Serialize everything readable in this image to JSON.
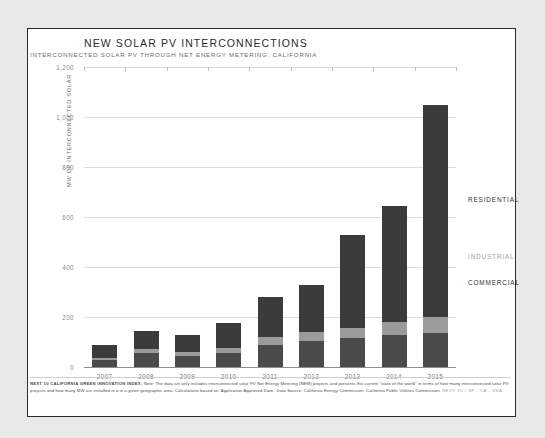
{
  "header": {
    "title": "NEW SOLAR PV INTERCONNECTIONS",
    "subtitle": "INTERCONNECTED SOLAR PV THROUGH NET ENERGY METERING, CALIFORNIA"
  },
  "legend": {
    "residential": "RESIDENTIAL",
    "industrial": "INDUSTRIAL",
    "commercial": "COMMERCIAL"
  },
  "colors": {
    "residential": "#3b3b3b",
    "industrial": "#9b9b9b",
    "commercial": "#4a4a4a",
    "frame": "#2a2a2a",
    "grid": "#dcdcdc",
    "page_background": "#e8e8e6"
  },
  "footnote": {
    "lead": "NEXT 10 CALIFORNIA GREEN INNOVATION INDEX.",
    "body": "Note: The data set only includes interconnected solar PV Net Energy Metering (NEM) projects and presents the current \"state of the world\" in terms of how many interconnected solar PV projects and how many MW are installed in a in a given geographic area. Calculations based on 'Application Approved Date.' Data Source: California Energy Commission; California Public Utilities Commission.",
    "tag": "NEXT 10 / SF - CA - USA"
  },
  "chart_data": {
    "type": "bar",
    "title": "NEW SOLAR PV INTERCONNECTIONS",
    "subtitle": "INTERCONNECTED SOLAR PV THROUGH NET ENERGY METERING, CALIFORNIA",
    "xlabel": "",
    "ylabel": "MW OF INTERCONNECTED SOLAR",
    "ylim": [
      0,
      1200
    ],
    "yticks": [
      0,
      200,
      400,
      600,
      800,
      1000,
      1200
    ],
    "ytick_labels": [
      "0",
      "200",
      "400",
      "600",
      "800",
      "1,000",
      "1,200"
    ],
    "grid": true,
    "stacked": true,
    "legend_position": "right",
    "categories": [
      "2007",
      "2008",
      "2009",
      "2010",
      "2011",
      "2012",
      "2013",
      "2014",
      "2015"
    ],
    "series": [
      {
        "name": "COMMERCIAL",
        "color": "#4a4a4a",
        "values": [
          30,
          55,
          45,
          55,
          90,
          105,
          115,
          130,
          135
        ]
      },
      {
        "name": "INDUSTRIAL",
        "color": "#9b9b9b",
        "values": [
          8,
          18,
          15,
          20,
          30,
          35,
          40,
          50,
          65
        ]
      },
      {
        "name": "RESIDENTIAL",
        "color": "#3b3b3b",
        "values": [
          52,
          72,
          70,
          100,
          160,
          190,
          375,
          465,
          850
        ]
      }
    ],
    "totals": [
      90,
      145,
      130,
      175,
      280,
      330,
      530,
      645,
      1050
    ]
  }
}
